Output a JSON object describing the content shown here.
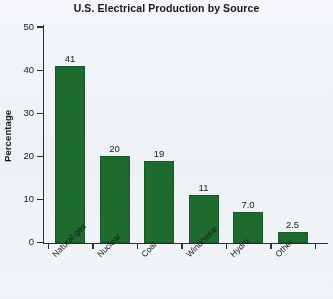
{
  "chart_data": {
    "type": "bar",
    "title": "U.S. Electrical Production by Source",
    "xlabel": "",
    "ylabel": "Percentage",
    "categories": [
      "Natural gas",
      "Nuclear",
      "Coal",
      "Wind/solar",
      "Hydro",
      "Other"
    ],
    "values": [
      41,
      20,
      19,
      11,
      7.0,
      2.5
    ],
    "value_labels": [
      "41",
      "20",
      "19",
      "11",
      "7.0",
      "2.5"
    ],
    "ylim": [
      0,
      50
    ],
    "yticks": [
      0,
      10,
      20,
      30,
      40,
      50
    ],
    "ytick_labels": [
      "0",
      "10",
      "20",
      "30",
      "40",
      "50"
    ],
    "grid": false,
    "legend": false,
    "bar_color": "#1e6b2f",
    "axis_color": "#2b2f33",
    "background_color": "#f3f6f9",
    "text_color": "#15171a"
  }
}
